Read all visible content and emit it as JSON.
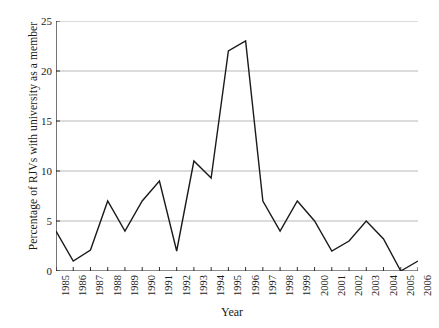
{
  "chart_data": {
    "type": "line",
    "title": "",
    "xlabel": "Year",
    "ylabel": "Percentage of RJVs with university as a member",
    "xlim": [
      1985,
      2006
    ],
    "ylim": [
      0,
      25
    ],
    "yticks": [
      0,
      5,
      10,
      15,
      20,
      25
    ],
    "grid": "horizontal",
    "legend": "none",
    "line_color": "#1a1a1a",
    "grid_color": "#b0b0b0",
    "axis_color": "#1a1a1a",
    "categories": [
      "1985",
      "1986",
      "1987",
      "1988",
      "1989",
      "1990",
      "1991",
      "1992",
      "1993",
      "1994",
      "1995",
      "1996",
      "1997",
      "1998",
      "1999",
      "2000",
      "2001",
      "2002",
      "2003",
      "2004",
      "2005",
      "2006"
    ],
    "values": [
      4.0,
      1.0,
      2.1,
      7.0,
      4.0,
      7.0,
      9.0,
      2.0,
      11.0,
      9.3,
      22.0,
      23.0,
      7.0,
      4.0,
      7.0,
      5.0,
      2.0,
      3.0,
      5.0,
      3.2,
      0.0,
      1.0
    ],
    "series": [
      {
        "name": "Percentage of RJVs with university as a member",
        "values": [
          4.0,
          1.0,
          2.1,
          7.0,
          4.0,
          7.0,
          9.0,
          2.0,
          11.0,
          9.3,
          22.0,
          23.0,
          7.0,
          4.0,
          7.0,
          5.0,
          2.0,
          3.0,
          5.0,
          3.2,
          0.0,
          1.0
        ]
      }
    ]
  }
}
